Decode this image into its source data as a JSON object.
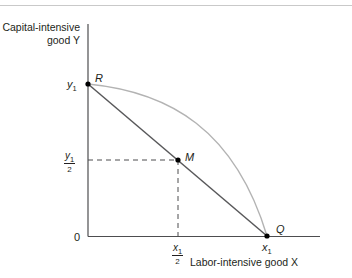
{
  "diagram": {
    "y_axis_title_line1": "Capital-intensive",
    "y_axis_title_line2": "good Y",
    "x_axis_title": "Labor-intensive good X",
    "origin_label": "0",
    "y_ticks": {
      "y1": {
        "var": "y",
        "sub": "1"
      },
      "y1_half": {
        "var": "y",
        "sub": "1",
        "den": "2"
      }
    },
    "x_ticks": {
      "x1": {
        "var": "x",
        "sub": "1"
      },
      "x1_half": {
        "var": "x",
        "sub": "1",
        "den": "2"
      }
    },
    "points": {
      "R": "R",
      "M": "M",
      "Q": "Q"
    },
    "colors": {
      "axis": "#4d4d4f",
      "straight_line": "#58585a",
      "curve": "#b3b3b3",
      "dashed": "#4d4d4f",
      "point": "#000000",
      "top_rule": "#c9c9c9"
    }
  }
}
